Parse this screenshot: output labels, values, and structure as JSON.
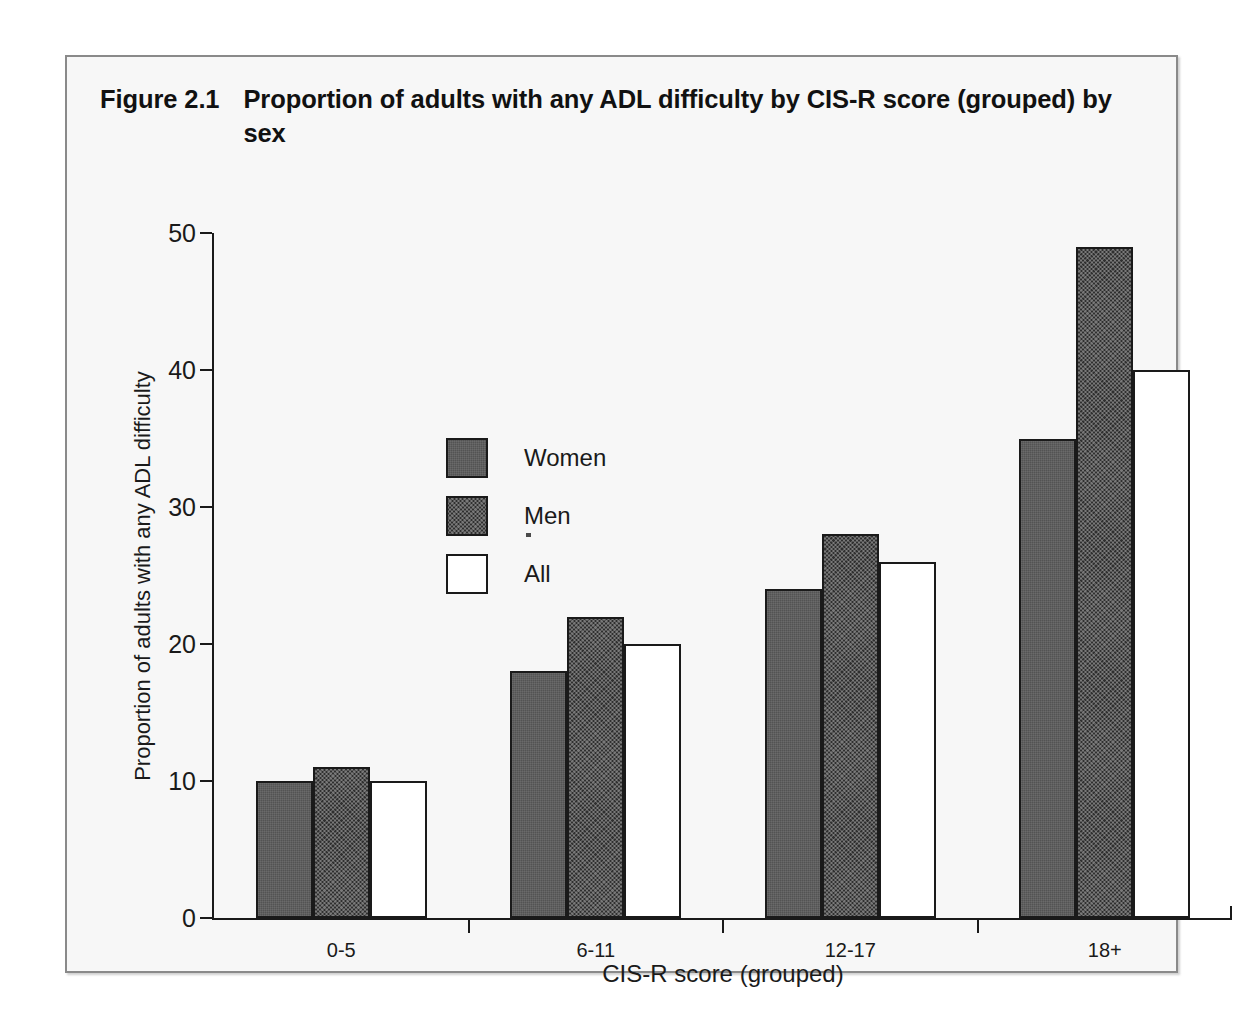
{
  "figure": {
    "number": "Figure 2.1",
    "title": "Proportion of adults with any ADL difficulty by CIS-R score (grouped) by sex"
  },
  "chart_data": {
    "type": "bar",
    "title": "Proportion of adults with any ADL difficulty by CIS-R score (grouped) by sex",
    "xlabel": "CIS-R score (grouped)",
    "ylabel": "Proportion of adults with any ADL difficulty",
    "categories": [
      "0-5",
      "6-11",
      "12-17",
      "18+"
    ],
    "series": [
      {
        "name": "Women",
        "values": [
          10,
          18,
          24,
          35
        ],
        "color": "#535353"
      },
      {
        "name": "Men",
        "values": [
          11,
          22,
          28,
          49
        ],
        "color": "#2f2f2f"
      },
      {
        "name": "All",
        "values": [
          10,
          20,
          26,
          40
        ],
        "color": "#ffffff"
      }
    ],
    "ylim": [
      0,
      50
    ],
    "yticks": [
      0,
      10,
      20,
      30,
      40,
      50
    ],
    "ytick_labels": [
      "0",
      "10",
      "20",
      "30",
      "40",
      "50"
    ],
    "grid": false,
    "legend_position": "upper left inside"
  },
  "legend": {
    "entries": [
      {
        "label": "Women",
        "swatch": "solid-gray"
      },
      {
        "label": "Men",
        "swatch": "dark-checker"
      },
      {
        "label": "All",
        "swatch": "white-outline"
      }
    ]
  },
  "colors": {
    "women": "#535353",
    "men": "#2f2f2f",
    "all": "#ffffff",
    "axis": "#1a1a1a",
    "frame": "#8a8a8a",
    "background": "#f7f7f7"
  }
}
